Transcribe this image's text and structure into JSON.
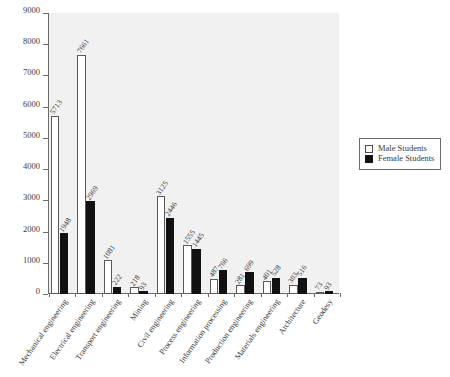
{
  "chart_data": {
    "type": "bar",
    "title": "",
    "subtitle": "",
    "xlabel": "",
    "ylabel": "",
    "ylim": [
      0,
      9000
    ],
    "grid": false,
    "legend_position": "right",
    "y_ticks": [
      "0",
      "1000",
      "2000",
      "3000",
      "4000",
      "5000",
      "6000",
      "7000",
      "8000",
      "9000"
    ],
    "categories": [
      "Mechanical engineering",
      "Electrical engineering",
      "Transport engineering",
      "Mining",
      "Civil engineering",
      "Process engineering",
      "Information processing",
      "Production engineering",
      "Materials engineering",
      "Architecture",
      "Geodesy"
    ],
    "series": [
      {
        "name": "Male Students",
        "color": "#ffffff",
        "values": [
          5713,
          7661,
          1081,
          218,
          3125,
          1555,
          487,
          281,
          401,
          303,
          73
        ]
      },
      {
        "name": "Female Students",
        "color": "#111111",
        "values": [
          1948,
          2969,
          222,
          93,
          2446,
          1445,
          766,
          699,
          528,
          516,
          93
        ]
      }
    ]
  },
  "legend": {
    "items": [
      {
        "label": "Male Students"
      },
      {
        "label": "Female Students"
      }
    ]
  }
}
